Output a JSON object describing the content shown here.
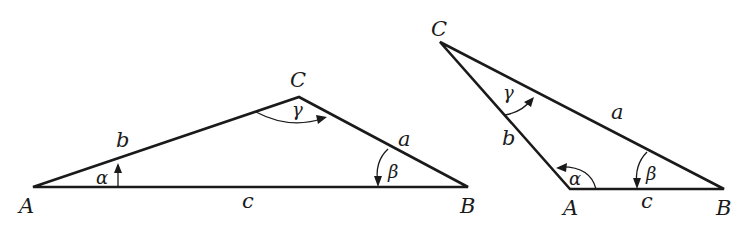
{
  "figure": {
    "triangles": [
      {
        "id": "left",
        "vertices": {
          "A": "A",
          "B": "B",
          "C": "C"
        },
        "sides": {
          "a": "a",
          "b": "b",
          "c": "c"
        },
        "angles": {
          "alpha": "α",
          "beta": "β",
          "gamma": "γ"
        }
      },
      {
        "id": "right",
        "vertices": {
          "A": "A",
          "B": "B",
          "C": "C"
        },
        "sides": {
          "a": "a",
          "b": "b",
          "c": "c"
        },
        "angles": {
          "alpha": "α",
          "beta": "β",
          "gamma": "γ"
        }
      }
    ]
  }
}
